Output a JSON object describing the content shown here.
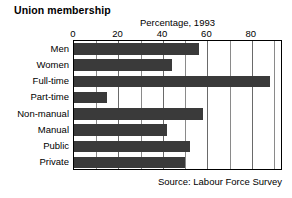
{
  "chart_data": {
    "type": "bar",
    "orientation": "horizontal",
    "title": "Union membership",
    "subtitle": "",
    "xlabel": "Percentage, 1993",
    "ylabel": "",
    "categories": [
      "Men",
      "Women",
      "Full-time",
      "Part-time",
      "Non-manual",
      "Manual",
      "Public",
      "Private"
    ],
    "values": [
      56,
      44,
      88,
      15,
      58,
      42,
      52,
      50
    ],
    "xlim": [
      0,
      94
    ],
    "xticks": [
      0,
      20,
      40,
      60,
      80
    ],
    "xtick_labels": [
      "0",
      "20",
      "40",
      "60",
      "80"
    ],
    "minor_gridlines": [
      10,
      30,
      50,
      70,
      90
    ],
    "grid": true,
    "legend": null,
    "annotations": [
      "Source: Labour Force Survey"
    ],
    "bar_color": "#3a3a3a",
    "grid_color": "#8a8a8a",
    "axis_color": "#000000",
    "background": "#ffffff"
  },
  "source_note": "Source: Labour Force Survey"
}
